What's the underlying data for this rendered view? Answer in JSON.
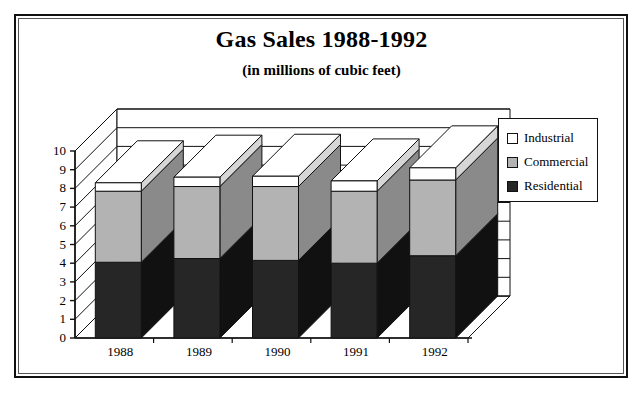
{
  "chart_data": {
    "type": "bar",
    "subtype": "stacked-3d-column",
    "title": "Gas Sales 1988-1992",
    "subtitle": "(in millions of cubic feet)",
    "xlabel": "",
    "ylabel": "",
    "categories": [
      "1988",
      "1989",
      "1990",
      "1991",
      "1992"
    ],
    "series": [
      {
        "name": "Residential",
        "color": "#262626",
        "values": [
          4.05,
          4.25,
          4.15,
          4.0,
          4.4
        ]
      },
      {
        "name": "Commercial",
        "color": "#b3b3b3",
        "values": [
          3.8,
          3.85,
          3.95,
          3.85,
          4.05
        ]
      },
      {
        "name": "Industrial",
        "color": "#ffffff",
        "values": [
          0.45,
          0.5,
          0.55,
          0.55,
          0.65
        ]
      }
    ],
    "stack_totals": [
      8.3,
      8.6,
      8.65,
      8.4,
      9.1
    ],
    "ylim": [
      0,
      10
    ],
    "yticks": [
      "0",
      "1",
      "2",
      "3",
      "4",
      "5",
      "6",
      "7",
      "8",
      "9",
      "10"
    ],
    "grid": true,
    "legend_position": "right",
    "stacked": true
  },
  "legend": {
    "items": [
      {
        "label": "Industrial",
        "color": "#ffffff"
      },
      {
        "label": "Commercial",
        "color": "#b3b3b3"
      },
      {
        "label": "Residential",
        "color": "#262626"
      }
    ]
  }
}
